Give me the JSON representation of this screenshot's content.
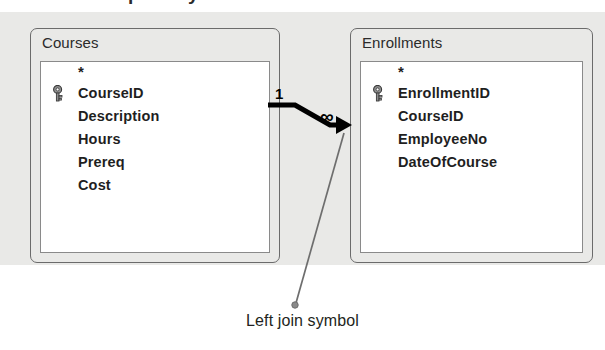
{
  "figure": {
    "clipped_heading_fragments": [
      "p",
      "y"
    ],
    "caption": "Left join symbol"
  },
  "canvas": {
    "background_color": "#e9e9e7"
  },
  "tables": [
    {
      "name": "Courses",
      "fields": [
        {
          "label": "*",
          "is_key": false,
          "is_star": true
        },
        {
          "label": "CourseID",
          "is_key": true,
          "is_star": false
        },
        {
          "label": "Description",
          "is_key": false,
          "is_star": false
        },
        {
          "label": "Hours",
          "is_key": false,
          "is_star": false
        },
        {
          "label": "Prereq",
          "is_key": false,
          "is_star": false
        },
        {
          "label": "Cost",
          "is_key": false,
          "is_star": false
        }
      ]
    },
    {
      "name": "Enrollments",
      "fields": [
        {
          "label": "*",
          "is_key": false,
          "is_star": true
        },
        {
          "label": "EnrollmentID",
          "is_key": true,
          "is_star": false
        },
        {
          "label": "CourseID",
          "is_key": false,
          "is_star": false
        },
        {
          "label": "EmployeeNo",
          "is_key": false,
          "is_star": false
        },
        {
          "label": "DateOfCourse",
          "is_key": false,
          "is_star": false
        }
      ]
    }
  ],
  "join": {
    "one_side_label": "1",
    "many_side_label": "∞",
    "join_type": "left join",
    "from_table": "Courses",
    "to_table": "Enrollments",
    "line_color": "#000000"
  },
  "colors": {
    "canvas": "#e9e9e7",
    "table_border": "#6b6b6b",
    "field_list_bg": "#ffffff",
    "text": "#1f1f1f",
    "leader_line": "#6e6e6e"
  }
}
